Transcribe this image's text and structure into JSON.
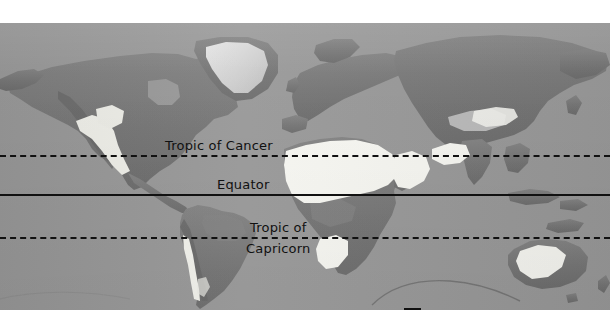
{
  "figure": {
    "kind": "world-map",
    "title_visible": false,
    "projection_hint": "equirectangular"
  },
  "colors": {
    "ocean": "#9a9a9a",
    "land": "#7c7c7c",
    "land_highland": "#6a6a6a",
    "ice": "#d8d8d8",
    "desert": "#f7f7f2",
    "line": "#111111",
    "page_background": "#ffffff"
  },
  "latitude_lines": [
    {
      "id": "tropic-of-cancer",
      "label": "Tropic of Cancer",
      "style": "dashed",
      "y": 155
    },
    {
      "id": "equator",
      "label": "Equator",
      "style": "solid",
      "y": 194
    },
    {
      "id": "tropic-of-capricorn",
      "label_line1": "Tropic of",
      "label_line2": "Capricorn",
      "style": "dashed",
      "y": 237
    }
  ],
  "legend": {
    "swatch_fill": "#ffffff",
    "text": "= Deserts"
  },
  "deserts_depicted": [
    "Sahara",
    "Arabian",
    "Kalahari / Namib",
    "Australian Outback",
    "Sonoran / Chihuahuan",
    "Atacama",
    "Thar",
    "Gobi / Taklamakan"
  ],
  "landmasses_depicted": [
    "North America",
    "Greenland",
    "South America",
    "Africa",
    "Europe",
    "Asia",
    "Australia",
    "Antarctica edge"
  ]
}
